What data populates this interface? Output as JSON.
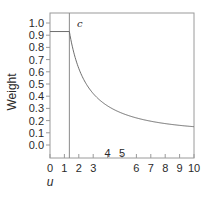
{
  "chart_data": {
    "type": "line",
    "title": "",
    "xlabel": "u",
    "ylabel": "Weight",
    "xlim": [
      0,
      10
    ],
    "ylim": [
      -0.3,
      1.1
    ],
    "xticks": [
      0,
      1,
      2,
      3,
      4,
      5,
      6,
      7,
      8,
      9,
      10
    ],
    "xtick_labels": [
      "0",
      "1",
      "2",
      "3",
      "4",
      "5",
      "6",
      "7",
      "8",
      "9",
      "10"
    ],
    "yticks": [
      0.0,
      0.1,
      0.2,
      0.3,
      0.4,
      0.5,
      0.6,
      0.7,
      0.8,
      0.9,
      1.0
    ],
    "ytick_labels": [
      "0.0",
      "0.1",
      "0.2",
      "0.3",
      "0.4",
      "0.5",
      "0.6",
      "0.7",
      "0.8",
      "0.9",
      "1.0"
    ],
    "grid": false,
    "annotation": "c",
    "cutoff_c": 1.345,
    "constant_weight": 0.93,
    "series": [
      {
        "name": "weight",
        "x": [
          0,
          1.345,
          1.5,
          2,
          2.5,
          3,
          3.5,
          4,
          4.5,
          5,
          6,
          7,
          8,
          9,
          10
        ],
        "y": [
          0.93,
          0.93,
          0.84,
          0.64,
          0.52,
          0.44,
          0.38,
          0.33,
          0.3,
          0.27,
          0.23,
          0.2,
          0.18,
          0.16,
          0.15
        ]
      }
    ]
  }
}
